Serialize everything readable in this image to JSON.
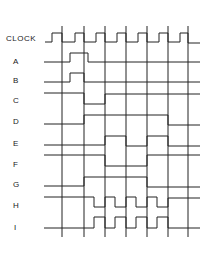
{
  "colors": {
    "ink": "#222222",
    "background": "#ffffff"
  },
  "edges_x": [
    62,
    84,
    105,
    126,
    147,
    168,
    188
  ],
  "grid": {
    "top": 26,
    "bottom": 237
  },
  "signals": [
    {
      "name": "CLOCK",
      "label_x": 6,
      "label_y": 41,
      "points": [
        [
          45,
          42
        ],
        [
          52,
          42
        ],
        [
          52,
          33
        ],
        [
          62,
          33
        ],
        [
          62,
          42
        ],
        [
          75,
          42
        ],
        [
          75,
          33
        ],
        [
          84,
          33
        ],
        [
          84,
          42
        ],
        [
          96,
          42
        ],
        [
          96,
          33
        ],
        [
          105,
          33
        ],
        [
          105,
          42
        ],
        [
          117,
          42
        ],
        [
          117,
          33
        ],
        [
          126,
          33
        ],
        [
          126,
          42
        ],
        [
          138,
          42
        ],
        [
          138,
          33
        ],
        [
          147,
          33
        ],
        [
          147,
          42
        ],
        [
          159,
          42
        ],
        [
          159,
          33
        ],
        [
          168,
          33
        ],
        [
          168,
          42
        ],
        [
          180,
          42
        ],
        [
          180,
          33
        ],
        [
          188,
          33
        ],
        [
          188,
          43
        ],
        [
          200,
          43
        ]
      ]
    },
    {
      "name": "A",
      "label_x": 13,
      "label_y": 64,
      "points": [
        [
          44,
          62
        ],
        [
          70,
          62
        ],
        [
          70,
          53
        ],
        [
          88,
          53
        ],
        [
          88,
          62
        ],
        [
          200,
          62
        ]
      ]
    },
    {
      "name": "B",
      "label_x": 13,
      "label_y": 83,
      "points": [
        [
          44,
          82
        ],
        [
          70,
          82
        ],
        [
          70,
          73
        ],
        [
          84,
          73
        ],
        [
          84,
          82
        ],
        [
          200,
          82
        ]
      ]
    },
    {
      "name": "C",
      "label_x": 13,
      "label_y": 103,
      "points": [
        [
          44,
          93
        ],
        [
          84,
          93
        ],
        [
          84,
          104
        ],
        [
          105,
          104
        ],
        [
          105,
          94
        ],
        [
          200,
          94
        ]
      ]
    },
    {
      "name": "D",
      "label_x": 13,
      "label_y": 124,
      "points": [
        [
          44,
          124
        ],
        [
          84,
          124
        ],
        [
          84,
          115
        ],
        [
          168,
          115
        ],
        [
          168,
          125
        ],
        [
          200,
          125
        ]
      ]
    },
    {
      "name": "E",
      "label_x": 13,
      "label_y": 146,
      "points": [
        [
          44,
          145
        ],
        [
          105,
          145
        ],
        [
          105,
          136
        ],
        [
          126,
          136
        ],
        [
          126,
          146
        ],
        [
          147,
          146
        ],
        [
          147,
          136
        ],
        [
          168,
          136
        ],
        [
          168,
          146
        ],
        [
          200,
          146
        ]
      ]
    },
    {
      "name": "F",
      "label_x": 13,
      "label_y": 167,
      "points": [
        [
          44,
          155
        ],
        [
          105,
          155
        ],
        [
          105,
          166
        ],
        [
          147,
          166
        ],
        [
          147,
          155
        ],
        [
          200,
          155
        ]
      ]
    },
    {
      "name": "G",
      "label_x": 13,
      "label_y": 187,
      "points": [
        [
          44,
          186
        ],
        [
          84,
          186
        ],
        [
          84,
          177
        ],
        [
          147,
          177
        ],
        [
          147,
          187
        ],
        [
          200,
          187
        ]
      ]
    },
    {
      "name": "H",
      "label_x": 13,
      "label_y": 208,
      "points": [
        [
          44,
          197
        ],
        [
          84,
          197
        ],
        [
          84,
          197
        ],
        [
          94,
          197
        ],
        [
          94,
          207
        ],
        [
          105,
          207
        ],
        [
          105,
          197
        ],
        [
          115,
          197
        ],
        [
          115,
          207
        ],
        [
          126,
          207
        ],
        [
          126,
          197
        ],
        [
          136,
          197
        ],
        [
          136,
          207
        ],
        [
          147,
          207
        ],
        [
          147,
          197
        ],
        [
          157,
          197
        ],
        [
          157,
          207
        ],
        [
          168,
          207
        ],
        [
          168,
          198
        ],
        [
          200,
          198
        ]
      ]
    },
    {
      "name": "I",
      "label_x": 14,
      "label_y": 230,
      "points": [
        [
          44,
          228
        ],
        [
          84,
          228
        ],
        [
          84,
          228
        ],
        [
          94,
          228
        ],
        [
          94,
          217
        ],
        [
          105,
          217
        ],
        [
          105,
          228
        ],
        [
          115,
          228
        ],
        [
          115,
          217
        ],
        [
          126,
          217
        ],
        [
          126,
          228
        ],
        [
          136,
          228
        ],
        [
          136,
          217
        ],
        [
          147,
          217
        ],
        [
          147,
          228
        ],
        [
          157,
          228
        ],
        [
          157,
          217
        ],
        [
          168,
          217
        ],
        [
          168,
          228
        ],
        [
          200,
          228
        ]
      ]
    }
  ],
  "extra_segments": [
    {
      "note": "C top line segment from left",
      "points": [
        [
          44,
          93
        ],
        [
          62,
          93
        ]
      ]
    }
  ]
}
